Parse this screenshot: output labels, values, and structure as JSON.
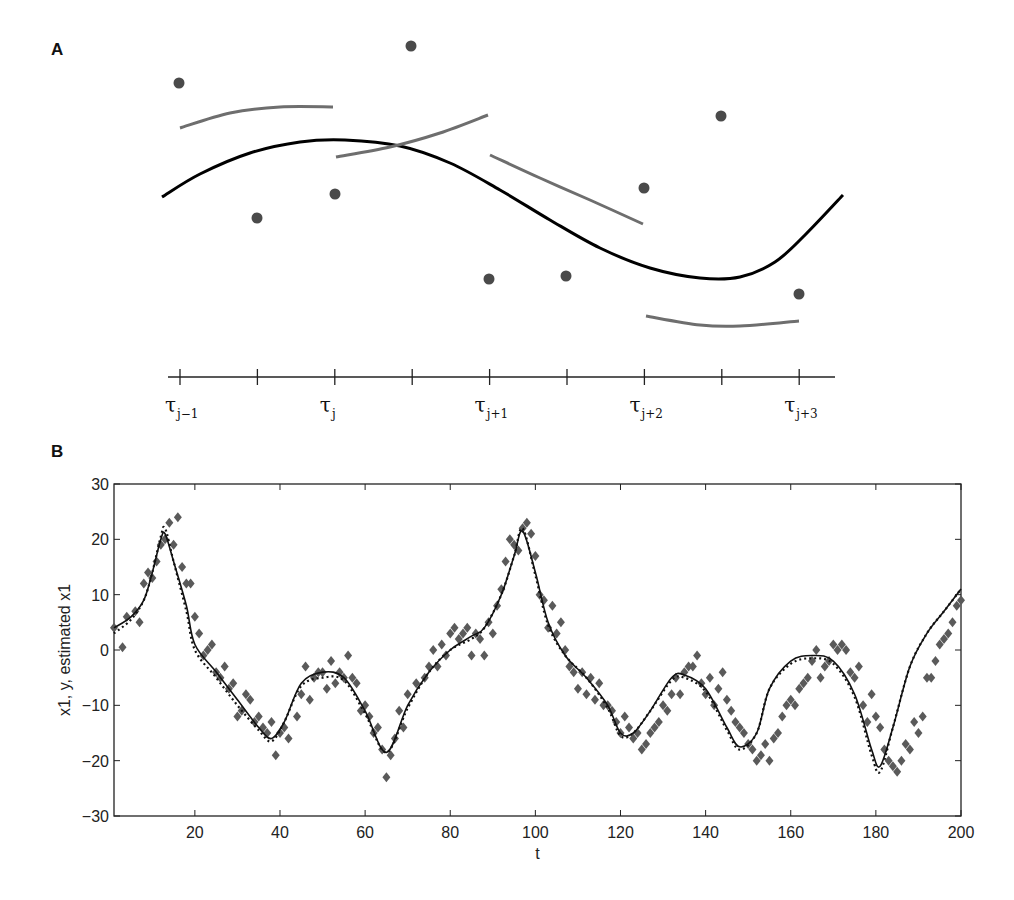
{
  "panels": {
    "a": {
      "label": "A"
    },
    "b": {
      "label": "B"
    }
  },
  "colors": {
    "black_curve": "#000000",
    "gray_segments": "#6e6e6e",
    "dots": "#4a4a4a",
    "scatter": "#5a5a5a",
    "axis": "#222222"
  },
  "chart_data": [
    {
      "type": "line",
      "title": "A",
      "description": "Smooth black spline through data points with local gray segment fits between knots",
      "xlabel": "",
      "ylabel": "",
      "knot_labels": [
        "τ_{j-1}",
        "",
        "τ_j",
        "",
        "τ_{j+1}",
        "",
        "τ_{j+2}",
        "",
        "τ_{j+3}"
      ],
      "knots_labeled": [
        {
          "base": "τ",
          "sub": "j−1"
        },
        {
          "base": "τ",
          "sub": "j"
        },
        {
          "base": "τ",
          "sub": "j+1"
        },
        {
          "base": "τ",
          "sub": "j+2"
        },
        {
          "base": "τ",
          "sub": "j+3"
        }
      ],
      "tick_count": 9,
      "points_px": [
        [
          179,
          83
        ],
        [
          257,
          218
        ],
        [
          335,
          194
        ],
        [
          411,
          46
        ],
        [
          489,
          279
        ],
        [
          566,
          276
        ],
        [
          644,
          188
        ],
        [
          721,
          116
        ],
        [
          799,
          294
        ]
      ],
      "black_curve_px": [
        [
          162,
          197
        ],
        [
          200,
          174
        ],
        [
          250,
          153
        ],
        [
          300,
          142
        ],
        [
          345,
          140
        ],
        [
          400,
          146
        ],
        [
          450,
          163
        ],
        [
          500,
          190
        ],
        [
          550,
          220
        ],
        [
          600,
          248
        ],
        [
          650,
          268
        ],
        [
          700,
          278
        ],
        [
          740,
          277
        ],
        [
          775,
          262
        ],
        [
          805,
          235
        ],
        [
          843,
          195
        ]
      ],
      "gray_segments_px": [
        [
          [
            180,
            128
          ],
          [
            230,
            113
          ],
          [
            280,
            107
          ],
          [
            333,
            107
          ]
        ],
        [
          [
            336,
            157
          ],
          [
            390,
            147
          ],
          [
            440,
            133
          ],
          [
            488,
            115
          ]
        ],
        [
          [
            490,
            155
          ],
          [
            540,
            178
          ],
          [
            590,
            200
          ],
          [
            643,
            224
          ]
        ],
        [
          [
            646,
            316
          ],
          [
            700,
            325
          ],
          [
            740,
            326
          ],
          [
            799,
            321
          ]
        ]
      ]
    },
    {
      "type": "line",
      "title": "B",
      "xlabel": "t",
      "ylabel": "x1, y, estimated x1",
      "xlim": [
        1,
        200
      ],
      "ylim": [
        -30,
        30
      ],
      "xticks": [
        20,
        40,
        60,
        80,
        100,
        120,
        140,
        160,
        180,
        200
      ],
      "yticks": [
        30,
        20,
        10,
        0,
        -10,
        -20,
        -30
      ],
      "ytick_labels": [
        "30",
        "20",
        "10",
        "0",
        "−10",
        "−20",
        "−30"
      ],
      "grid": false,
      "series": [
        {
          "name": "x1 (true)",
          "style": "solid",
          "x": [
            1,
            5,
            8,
            10,
            12,
            13,
            15,
            18,
            20,
            25,
            30,
            35,
            38,
            41,
            45,
            50,
            55,
            60,
            65,
            70,
            75,
            80,
            85,
            88,
            92,
            95,
            97,
            100,
            103,
            107,
            112,
            117,
            120,
            123,
            127,
            132,
            135,
            140,
            145,
            148,
            152,
            155,
            160,
            165,
            170,
            175,
            179,
            181,
            184,
            188,
            192,
            196,
            200
          ],
          "y": [
            4,
            6,
            9,
            14,
            20,
            21,
            16,
            8,
            1,
            -4,
            -9,
            -14,
            -16,
            -13,
            -6,
            -4,
            -5,
            -11,
            -18.5,
            -10,
            -4,
            0,
            2.5,
            4,
            10,
            17,
            21.5,
            14,
            5,
            -1,
            -5,
            -10,
            -15,
            -15,
            -11,
            -5,
            -4.5,
            -7,
            -14,
            -17.5,
            -15,
            -7,
            -2,
            -1,
            -2,
            -8,
            -18,
            -21,
            -14,
            -3,
            3,
            7,
            11
          ]
        },
        {
          "name": "estimated x1",
          "style": "dotted",
          "x": [
            1,
            5,
            8,
            10,
            12,
            13,
            15,
            18,
            20,
            25,
            30,
            35,
            38,
            41,
            45,
            50,
            55,
            60,
            65,
            70,
            75,
            80,
            85,
            88,
            92,
            95,
            97,
            100,
            103,
            107,
            112,
            117,
            120,
            123,
            127,
            132,
            135,
            140,
            145,
            148,
            152,
            155,
            160,
            165,
            170,
            175,
            179,
            181,
            184,
            188,
            192,
            196,
            200
          ],
          "y": [
            3,
            5.5,
            9,
            14,
            20.5,
            22,
            16,
            7,
            0,
            -5,
            -10,
            -14.5,
            -16.5,
            -13,
            -6.5,
            -5,
            -5.5,
            -11.5,
            -18.5,
            -10.5,
            -4,
            0,
            2,
            4,
            10,
            17,
            22,
            13.5,
            4.5,
            -1,
            -5,
            -10.5,
            -15.5,
            -15,
            -11,
            -5.5,
            -5,
            -7.5,
            -14.5,
            -18,
            -15,
            -7,
            -2.5,
            -1.5,
            -2.5,
            -8.5,
            -19,
            -22,
            -14,
            -3,
            3,
            7,
            11
          ]
        },
        {
          "name": "y (observations)",
          "style": "diamond-markers",
          "x": [
            1,
            3,
            4,
            6,
            7,
            8,
            9,
            10,
            11,
            12,
            13,
            14,
            15,
            16,
            17,
            18,
            19,
            20,
            21,
            22,
            23,
            24,
            25,
            26,
            27,
            28,
            29,
            30,
            31,
            32,
            33,
            34,
            35,
            36,
            37,
            38,
            39,
            40,
            41,
            42,
            44,
            45,
            46,
            47,
            48,
            49,
            50,
            51,
            52,
            53,
            54,
            55,
            56,
            57,
            58,
            59,
            60,
            61,
            62,
            63,
            64,
            65,
            66,
            67,
            68,
            69,
            70,
            72,
            74,
            75,
            76,
            77,
            78,
            79,
            80,
            81,
            82,
            83,
            84,
            85,
            86,
            87,
            88,
            89,
            90,
            91,
            92,
            93,
            94,
            95,
            96,
            97,
            98,
            99,
            100,
            101,
            102,
            103,
            104,
            105,
            106,
            107,
            108,
            109,
            110,
            111,
            112,
            113,
            114,
            115,
            116,
            117,
            118,
            119,
            120,
            121,
            122,
            123,
            124,
            125,
            126,
            127,
            128,
            129,
            130,
            131,
            132,
            133,
            134,
            135,
            136,
            137,
            138,
            139,
            140,
            141,
            142,
            143,
            144,
            145,
            146,
            147,
            148,
            149,
            150,
            151,
            152,
            153,
            154,
            155,
            156,
            157,
            158,
            159,
            160,
            161,
            162,
            163,
            164,
            165,
            166,
            167,
            168,
            169,
            170,
            171,
            172,
            173,
            174,
            175,
            176,
            177,
            178,
            179,
            180,
            181,
            182,
            183,
            184,
            185,
            186,
            187,
            188,
            189,
            190,
            191,
            192,
            193,
            194,
            195,
            196,
            197,
            198,
            199,
            200
          ],
          "y": [
            4,
            0.5,
            6,
            7,
            5,
            12,
            14,
            13,
            16,
            19,
            20,
            23,
            19,
            24,
            15,
            12,
            12,
            6,
            3,
            -1,
            0,
            1,
            -4,
            -5,
            -3,
            -7,
            -6,
            -12,
            -11,
            -8,
            -9,
            -13,
            -12,
            -14,
            -15,
            -13,
            -19,
            -15,
            -14,
            -16,
            -12,
            -8,
            -3,
            -9,
            -5,
            -4,
            -4,
            -7,
            -2,
            -6,
            -4,
            -5,
            -1,
            -5,
            -6,
            -11,
            -10,
            -12,
            -15,
            -14,
            -18,
            -23,
            -19,
            -16,
            -11,
            -14,
            -8,
            -6,
            -5,
            -3,
            0,
            -3,
            1,
            -1,
            3,
            4,
            2,
            3,
            4,
            -1,
            3,
            2,
            -1,
            5,
            3,
            8,
            11,
            16,
            20,
            19,
            18,
            22,
            23,
            21,
            17,
            10,
            9,
            4,
            8,
            3,
            5,
            0,
            -3,
            -4,
            -7,
            -4,
            -8,
            -5,
            -9,
            -6,
            -10,
            -10,
            -11,
            -13,
            -15,
            -12,
            -14,
            -16,
            -15,
            -18,
            -17,
            -15,
            -14,
            -13,
            -10,
            -11,
            -8,
            -5,
            -8,
            -4,
            -3,
            -3,
            -1,
            -6,
            -8,
            -5,
            -10,
            -7,
            -4,
            -9,
            -11,
            -13,
            -14,
            -15,
            -17,
            -18,
            -20,
            -19,
            -17,
            -20,
            -16,
            -15,
            -12,
            -10,
            -9,
            -10,
            -7,
            -6,
            -5,
            -2,
            0,
            -5,
            -3,
            -2,
            1,
            0,
            1,
            0,
            -4,
            -5,
            -3,
            -10,
            -13,
            -8,
            -12,
            -14,
            -18,
            -20,
            -21,
            -22,
            -20,
            -17,
            -18,
            -13,
            -15,
            -12,
            -5,
            -5,
            -2,
            1,
            2,
            3,
            5,
            8,
            9,
            7,
            8,
            7,
            6,
            8,
            10,
            12,
            14,
            9
          ]
        }
      ]
    }
  ]
}
